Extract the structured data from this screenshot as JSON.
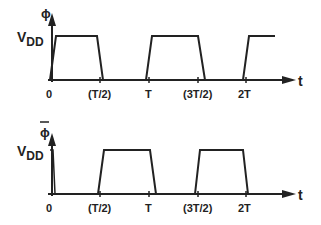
{
  "diagram": {
    "stroke_color": "#222222",
    "top_plot": {
      "signal_label": "ϕ",
      "level_label_main": "V",
      "level_label_sub": "DD",
      "axis_label": "t",
      "ticks": [
        "0",
        "(T/2)",
        "T",
        "(3T/2)",
        "2T"
      ]
    },
    "bottom_plot": {
      "signal_label": "ϕ",
      "signal_overbar": true,
      "level_label_main": "V",
      "level_label_sub": "DD",
      "axis_label": "t",
      "ticks": [
        "0",
        "(T/2)",
        "T",
        "(3T/2)",
        "2T"
      ]
    }
  }
}
